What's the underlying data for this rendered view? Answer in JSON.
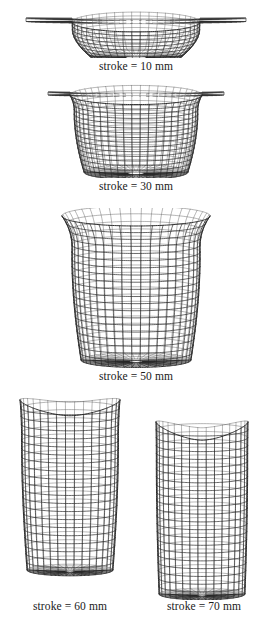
{
  "figure": {
    "type": "fem-mesh-sequence",
    "background_color": "#ffffff",
    "mesh_color": "#262626",
    "mesh_light_color": "#5c5c5c",
    "caption_color": "#1a1a1a",
    "panels": [
      {
        "id": "stroke-10",
        "caption": "stroke = 10 mm",
        "stroke_mm": 10,
        "x": 0,
        "y": 6,
        "w": 272,
        "h": 52,
        "caption_x": 0,
        "caption_y": 60,
        "caption_w": 272,
        "geometry": {
          "flange": true,
          "flange_half_width": 110,
          "flange_y": 12,
          "flange_thickness": 3.5,
          "rim_half_width": 64,
          "rim_y": 16,
          "bottom_half_width": 46,
          "bottom_y": 50,
          "wall_depth": 34,
          "corner_radius": 20,
          "rim_flare": 0.02,
          "n_vertical": 23,
          "n_horizontal": 9,
          "ellipse_k": 0.155,
          "cx": 136
        }
      },
      {
        "id": "stroke-30",
        "caption": "stroke = 30 mm",
        "stroke_mm": 30,
        "x": 0,
        "y": 84,
        "w": 272,
        "h": 94,
        "caption_x": 0,
        "caption_y": 180,
        "caption_w": 272,
        "geometry": {
          "flange": true,
          "flange_half_width": 88,
          "flange_y": 8,
          "flange_thickness": 3.0,
          "rim_half_width": 66,
          "rim_y": 11,
          "bottom_half_width": 52,
          "bottom_y": 88,
          "wall_depth": 77,
          "corner_radius": 17,
          "rim_flare": 0.3,
          "n_vertical": 23,
          "n_horizontal": 16,
          "ellipse_k": 0.145,
          "cx": 136
        }
      },
      {
        "id": "stroke-50",
        "caption": "stroke = 50 mm",
        "stroke_mm": 50,
        "x": 0,
        "y": 208,
        "w": 272,
        "h": 160,
        "caption_x": 0,
        "caption_y": 370,
        "caption_w": 272,
        "geometry": {
          "flange": false,
          "flange_half_width": 0,
          "flange_y": 0,
          "flange_thickness": 0,
          "rim_half_width": 74,
          "rim_y": 8,
          "bottom_half_width": 55,
          "bottom_y": 152,
          "wall_depth": 144,
          "corner_radius": 18,
          "rim_flare": 0.52,
          "n_vertical": 21,
          "n_horizontal": 20,
          "ellipse_k": 0.135,
          "cx": 136
        }
      },
      {
        "id": "stroke-60",
        "caption": "stroke = 60 mm",
        "stroke_mm": 60,
        "x": 8,
        "y": 392,
        "w": 124,
        "h": 186,
        "caption_x": 2,
        "caption_y": 600,
        "caption_w": 136,
        "geometry": {
          "flange": false,
          "flange_half_width": 0,
          "flange_y": 0,
          "flange_thickness": 0,
          "rim_half_width": 50,
          "rim_y": 8,
          "bottom_half_width": 43,
          "bottom_y": 178,
          "wall_depth": 170,
          "corner_radius": 17,
          "rim_flare": 0.22,
          "rim_saddle": 9,
          "n_vertical": 17,
          "n_horizontal": 21,
          "ellipse_k": 0.135,
          "cx": 62
        }
      },
      {
        "id": "stroke-70",
        "caption": "stroke = 70 mm",
        "stroke_mm": 70,
        "x": 140,
        "y": 414,
        "w": 124,
        "h": 186,
        "caption_x": 136,
        "caption_y": 600,
        "caption_w": 136,
        "geometry": {
          "flange": false,
          "flange_half_width": 0,
          "flange_y": 0,
          "flange_thickness": 0,
          "rim_half_width": 46,
          "rim_y": 8,
          "bottom_half_width": 43,
          "bottom_y": 180,
          "wall_depth": 172,
          "corner_radius": 16,
          "rim_flare": 0.12,
          "rim_saddle": 12,
          "n_vertical": 17,
          "n_horizontal": 22,
          "ellipse_k": 0.135,
          "cx": 62
        }
      }
    ]
  }
}
